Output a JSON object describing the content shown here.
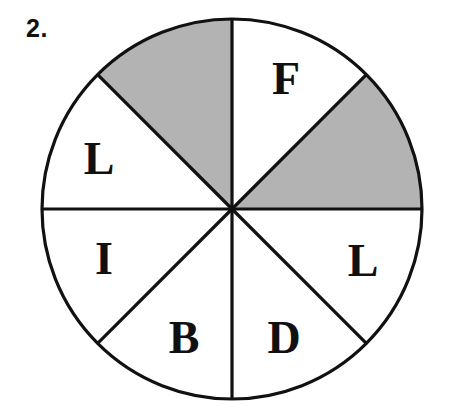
{
  "figure": {
    "number_label": "2.",
    "type": "spinner-wheel",
    "background_color": "#ffffff",
    "outline_color": "#111111",
    "shaded_color": "#b3b3b3",
    "unshaded_color": "#ffffff",
    "center_x": 232,
    "center_y": 209,
    "radius": 190,
    "sector_count": 8,
    "sector_degrees": 45
  },
  "chart_data": {
    "type": "pie",
    "title": "2.",
    "xlabel": "",
    "ylabel": "",
    "categories": [
      "F",
      "shaded",
      "L",
      "D",
      "B",
      "I",
      "L",
      "shaded"
    ],
    "values": [
      45,
      45,
      45,
      45,
      45,
      45,
      45,
      45
    ],
    "legend": [],
    "grid": false,
    "slices": [
      {
        "index": 0,
        "label": "F",
        "start_angle": 0,
        "end_angle": 45,
        "shaded": false,
        "fill": "#ffffff",
        "label_x": 286,
        "label_y": 83
      },
      {
        "index": 1,
        "label": "",
        "start_angle": 45,
        "end_angle": 90,
        "shaded": true,
        "fill": "#b3b3b3",
        "label_x": 0,
        "label_y": 0
      },
      {
        "index": 2,
        "label": "L",
        "start_angle": 90,
        "end_angle": 135,
        "shaded": false,
        "fill": "#ffffff",
        "label_x": 363,
        "label_y": 265
      },
      {
        "index": 3,
        "label": "D",
        "start_angle": 135,
        "end_angle": 180,
        "shaded": false,
        "fill": "#ffffff",
        "label_x": 284,
        "label_y": 342
      },
      {
        "index": 4,
        "label": "B",
        "start_angle": 180,
        "end_angle": 225,
        "shaded": false,
        "fill": "#ffffff",
        "label_x": 184,
        "label_y": 342
      },
      {
        "index": 5,
        "label": "I",
        "start_angle": 225,
        "end_angle": 270,
        "shaded": false,
        "fill": "#ffffff",
        "label_x": 104,
        "label_y": 263
      },
      {
        "index": 6,
        "label": "L",
        "start_angle": 270,
        "end_angle": 315,
        "shaded": false,
        "fill": "#ffffff",
        "label_x": 99,
        "label_y": 163
      },
      {
        "index": 7,
        "label": "",
        "start_angle": 315,
        "end_angle": 360,
        "shaded": true,
        "fill": "#b3b3b3",
        "label_x": 0,
        "label_y": 0
      }
    ]
  }
}
